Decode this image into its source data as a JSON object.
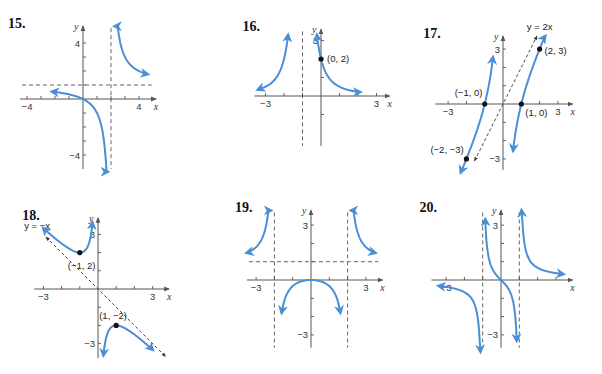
{
  "colors": {
    "curve": "#4a8fd6",
    "axis": "#555555",
    "dashed": "#555555",
    "point": "#111111",
    "background": "#ffffff"
  },
  "chart_data": [
    {
      "id": "15",
      "type": "line",
      "title": "15.",
      "xlabel": "x",
      "ylabel": "y",
      "origin": [
        83,
        99
      ],
      "scale": 14,
      "xlim": [
        -4.5,
        5.2
      ],
      "ylim": [
        -5,
        5.2
      ],
      "xticks": [
        -4,
        -3,
        -2,
        -1,
        1,
        2,
        3,
        4
      ],
      "yticks": [
        -4,
        -3,
        -2,
        -1,
        1,
        2,
        3,
        4
      ],
      "xtick_labels": [
        {
          "v": -4,
          "t": "−4"
        },
        {
          "v": 4,
          "t": "4"
        }
      ],
      "ytick_labels": [
        {
          "v": 4,
          "t": "4"
        },
        {
          "v": -4,
          "t": "−4"
        }
      ],
      "asymptotes": {
        "vertical": [
          2
        ],
        "horizontal": [
          1
        ],
        "oblique": []
      },
      "points": [],
      "curves": [
        {
          "desc": "left branch",
          "fn": "x/(x-2)",
          "x": [
            -2.2,
            1.75
          ]
        },
        {
          "desc": "right branch",
          "fn": "x/(x-2)",
          "x": [
            2.28,
            4.6
          ]
        }
      ]
    },
    {
      "id": "16",
      "type": "line",
      "title": "16.",
      "xlabel": "x",
      "ylabel": "y",
      "origin": [
        321,
        96
      ],
      "scale": 18.5,
      "xlim": [
        -3.6,
        3.7
      ],
      "ylim": [
        -2.7,
        3.6
      ],
      "xticks": [
        -3,
        -2,
        -1,
        1,
        2,
        3
      ],
      "yticks": [
        -1,
        1,
        2,
        3
      ],
      "xtick_labels": [
        {
          "v": -3,
          "t": "−3"
        },
        {
          "v": 3,
          "t": "3"
        }
      ],
      "ytick_labels": [
        {
          "v": 3,
          "t": "3"
        }
      ],
      "asymptotes": {
        "vertical": [
          -1
        ],
        "horizontal": [],
        "oblique": []
      },
      "points": [
        {
          "x": 0,
          "y": 2,
          "label": "(0, 2)",
          "dx": 6,
          "dy": 3
        }
      ],
      "curves": [
        {
          "desc": "left branch",
          "fn": "2/(x+1)^2",
          "x": [
            -3.4,
            -1.78
          ]
        },
        {
          "desc": "right branch",
          "fn": "2/(x+1)^2",
          "x": [
            -0.22,
            2.1
          ]
        }
      ]
    },
    {
      "id": "17",
      "type": "line",
      "title": "17.",
      "xlabel": "x",
      "ylabel": "y",
      "origin": [
        503,
        104
      ],
      "scale": 18.3,
      "xlim": [
        -3.7,
        3.8
      ],
      "ylim": [
        -3.6,
        3.7
      ],
      "xticks": [
        -3,
        -2,
        -1,
        1,
        2,
        3
      ],
      "yticks": [
        -3,
        -2,
        -1,
        1,
        2,
        3
      ],
      "xtick_labels": [
        {
          "v": -3,
          "t": "−3"
        },
        {
          "v": 3,
          "t": "3"
        }
      ],
      "ytick_labels": [
        {
          "v": 3,
          "t": "3"
        },
        {
          "v": -3,
          "t": "−3"
        }
      ],
      "asymptotes": {
        "vertical": [
          0
        ],
        "horizontal": [],
        "oblique": [
          {
            "label": "y = 2x",
            "m": 2,
            "b": 0
          }
        ]
      },
      "points": [
        {
          "x": -1,
          "y": 0,
          "label": "(−1, 0)",
          "dx": -30,
          "dy": -8
        },
        {
          "x": 1,
          "y": 0,
          "label": "(1, 0)",
          "dx": 4,
          "dy": 12
        },
        {
          "x": 2,
          "y": 3,
          "label": "(2, 3)",
          "dx": 5,
          "dy": 5
        },
        {
          "x": -2,
          "y": -3,
          "label": "(−2, −3)",
          "dx": -36,
          "dy": -6
        }
      ],
      "curves": [
        {
          "desc": "left branch",
          "fn": "(2x^2-2)/x (shaped)",
          "x": [
            -2.3,
            -0.55
          ]
        },
        {
          "desc": "right branch",
          "fn": "(2x^2-2)/x (shaped)",
          "x": [
            0.55,
            2.3
          ]
        }
      ]
    },
    {
      "id": "18",
      "type": "line",
      "title": "18.",
      "xlabel": "x",
      "ylabel": "y",
      "origin": [
        98,
        289
      ],
      "scale": 18.2,
      "xlim": [
        -3.5,
        3.9
      ],
      "ylim": [
        -3.8,
        3.9
      ],
      "xticks": [
        -3,
        -2,
        -1,
        1,
        2,
        3
      ],
      "yticks": [
        -3,
        -2,
        -1,
        1,
        2,
        3
      ],
      "xtick_labels": [
        {
          "v": -3,
          "t": "−3"
        },
        {
          "v": 3,
          "t": "3"
        }
      ],
      "ytick_labels": [
        {
          "v": 3,
          "t": "3"
        },
        {
          "v": -3,
          "t": "−3"
        }
      ],
      "asymptotes": {
        "vertical": [
          0
        ],
        "horizontal": [],
        "oblique": [
          {
            "label": "y = −x",
            "m": -1,
            "b": 0
          }
        ]
      },
      "points": [
        {
          "x": -1,
          "y": 2,
          "label": "(−1, 2)",
          "dx": -12,
          "dy": 16
        },
        {
          "x": 1,
          "y": -2,
          "label": "(1, −2)",
          "dx": -17,
          "dy": -6
        }
      ],
      "curves": [
        {
          "desc": "upper-left branch",
          "fn": "-x - 1/x shaped",
          "x": [
            -3.0,
            -0.3
          ]
        },
        {
          "desc": "lower-right branch",
          "fn": "-x - 1/x shaped",
          "x": [
            0.3,
            3.0
          ]
        }
      ]
    },
    {
      "id": "19",
      "type": "line",
      "title": "19.",
      "xlabel": "x",
      "ylabel": "y",
      "origin": [
        311,
        280
      ],
      "scale": 18.3,
      "xlim": [
        -3.5,
        3.9
      ],
      "ylim": [
        -3.7,
        3.8
      ],
      "xticks": [
        -3,
        -2,
        -1,
        1,
        2,
        3
      ],
      "yticks": [
        -3,
        -2,
        -1,
        1,
        2,
        3
      ],
      "xtick_labels": [
        {
          "v": -3,
          "t": "−3"
        },
        {
          "v": 3,
          "t": "3"
        }
      ],
      "ytick_labels": [
        {
          "v": 3,
          "t": "3"
        },
        {
          "v": -3,
          "t": "−3"
        }
      ],
      "asymptotes": {
        "vertical": [
          -2,
          2
        ],
        "horizontal": [
          1
        ],
        "oblique": []
      },
      "points": [],
      "curves": [
        {
          "desc": "left branch",
          "fn": "x^2/(x^2-4)",
          "x": [
            -3.5,
            -2.2
          ]
        },
        {
          "desc": "middle branch",
          "fn": "x^2/(x^2-4)",
          "x": [
            -1.6,
            1.6
          ]
        },
        {
          "desc": "right branch",
          "fn": "x^2/(x^2-4)",
          "x": [
            2.2,
            3.5
          ]
        }
      ]
    },
    {
      "id": "20",
      "type": "line",
      "title": "20.",
      "xlabel": "x",
      "ylabel": "y",
      "origin": [
        501,
        280
      ],
      "scale": 18.3,
      "xlim": [
        -3.8,
        3.9
      ],
      "ylim": [
        -3.7,
        3.8
      ],
      "xticks": [
        -3,
        -2,
        -1,
        1,
        2,
        3
      ],
      "yticks": [
        -3,
        -2,
        -1,
        1,
        2,
        3
      ],
      "xtick_labels": [
        {
          "v": -3,
          "t": "−3"
        }
      ],
      "ytick_labels": [
        {
          "v": 3,
          "t": "3"
        },
        {
          "v": -3,
          "t": "−3"
        }
      ],
      "asymptotes": {
        "vertical": [
          -1,
          1
        ],
        "horizontal": [
          0
        ],
        "oblique": []
      },
      "points": [],
      "curves": [
        {
          "desc": "left branch",
          "fn": "x/(x^2-1)",
          "x": [
            -3.4,
            -1.12
          ]
        },
        {
          "desc": "middle branch",
          "fn": "x/(x^2-1)",
          "x": [
            -0.86,
            0.86
          ]
        },
        {
          "desc": "right branch",
          "fn": "x/(x^2-1)",
          "x": [
            1.12,
            3.4
          ]
        }
      ]
    }
  ]
}
